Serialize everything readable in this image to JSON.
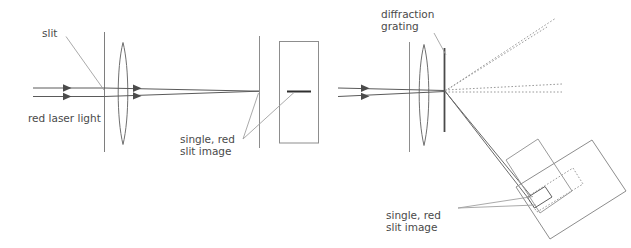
{
  "figure": {
    "panels": [
      {
        "id": "left-panel",
        "name": "no-grating-setup",
        "description": "Red laser light through a slit and lens forms a single red slit image on a flat screen"
      },
      {
        "id": "right-panel",
        "name": "grating-setup",
        "description": "Red laser light through a slit, lens and diffraction grating forms orders on a tilted screen"
      }
    ]
  },
  "colors": {
    "background": "#ffffff",
    "line": "#555555",
    "line_light": "#8d8d8d",
    "line_dark": "#3c3c3c",
    "text": "#4a4a4a",
    "slit_image_bar": "#2f2f2f",
    "grating": "#4a4a4a",
    "ray_solid": "#6a6a6a",
    "ray_dotted": "#9a9a9a"
  },
  "left": {
    "labels": {
      "slit": "slit",
      "source": "red laser light",
      "image_line1": "single, red",
      "image_line2": "slit image"
    },
    "components": {
      "slit_plate": "slit-plate",
      "lens": "converging-lens",
      "focal_plane": "focal-plane-line",
      "screen": "viewing-screen",
      "slit_image_bar": "single-red-slit-image"
    },
    "rays": {
      "incoming_count": 2,
      "arrow_count": 4,
      "style": "solid"
    }
  },
  "right": {
    "labels": {
      "grating_line1": "diffraction",
      "grating_line2": "grating",
      "image_line1": "single, red",
      "image_line2": "slit image"
    },
    "components": {
      "slit_plate": "slit-plate",
      "lens": "converging-lens",
      "grating": "diffraction-grating",
      "screen": "tilted-viewing-screen",
      "spectrum": "dotted-spectrum-band",
      "slit_image_box": "single-red-slit-image-box"
    },
    "rays": {
      "incoming_count": 2,
      "arrow_count": 2,
      "diffracted_dotted_count": 4,
      "diffracted_solid_count": 2,
      "style": "solid incoming, dotted diffracted orders"
    }
  }
}
